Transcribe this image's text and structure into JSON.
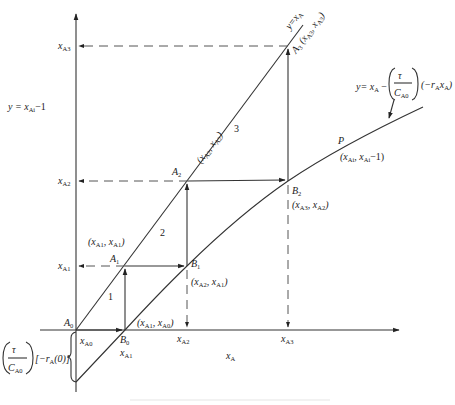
{
  "diagram": {
    "axis": {
      "x_label": "x_A",
      "y_label": "y = x_Ai-1"
    },
    "lines": {
      "operating_line": "y = x_A",
      "reaction_curve": "y = x_A - (τ / C_A0)(-r_A x_A)"
    },
    "reaction_curve_label": {
      "y_eq": "y= x",
      "A": "A",
      "minus": " -",
      "tau": "τ",
      "C": "C",
      "A0": "A0",
      "rate": "(-r",
      "rate_A": "A",
      "rate_x": "x",
      "rate_xA": "A",
      "close": ")"
    },
    "intercept_label": {
      "tau": "τ",
      "C": "C",
      "A0": "A0",
      "text": "[-r",
      "text_A": "A",
      "text_end": "(0)]"
    },
    "y_ticks": [
      {
        "name": "x",
        "sub": "A3"
      },
      {
        "name": "x",
        "sub": "A2"
      },
      {
        "name": "x",
        "sub": "A1"
      }
    ],
    "x_ticks": [
      {
        "name": "x",
        "sub": "A0"
      },
      {
        "name": "x",
        "sub": "A1"
      },
      {
        "name": "x",
        "sub": "A2"
      },
      {
        "name": "x",
        "sub": "A3"
      }
    ],
    "points": {
      "A0": {
        "name": "A",
        "sub": "0"
      },
      "A1": {
        "name": "A",
        "sub": "1",
        "coord": "(x_A1, x_A1)"
      },
      "A2": {
        "name": "A",
        "sub": "2",
        "coord": "(x_A2, x_A2)"
      },
      "A3": {
        "name": "A",
        "sub": "3",
        "coord": "(x_A3, x_A3)"
      },
      "B0": {
        "name": "B",
        "sub": "0",
        "coord": "(x_A1, x_A0)"
      },
      "B1": {
        "name": "B",
        "sub": "1",
        "coord": "(x_A2, x_A1)"
      },
      "B2": {
        "name": "B",
        "sub": "2",
        "coord": "(x_A3, x_A2)"
      },
      "P": {
        "name": "P",
        "coord": "(x_Ai, x_Ai-1)"
      }
    },
    "stage_numbers": [
      "1",
      "2",
      "3"
    ]
  }
}
